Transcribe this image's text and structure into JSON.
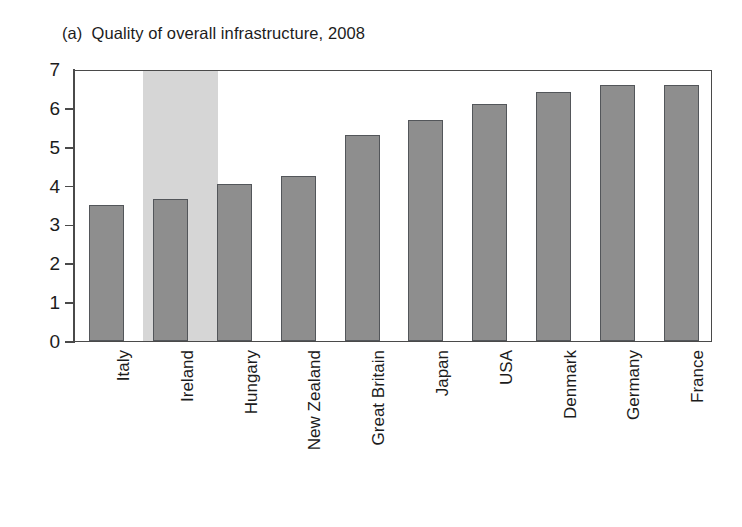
{
  "chart_data": {
    "type": "bar",
    "title_tag": "(a)",
    "title_text": "Quality of overall infrastructure, 2008",
    "xlabel": "",
    "ylabel": "",
    "ylim": [
      0,
      7
    ],
    "ytick_labels": [
      "7",
      "6",
      "5",
      "4",
      "3",
      "2",
      "1",
      "0"
    ],
    "ytick_values": [
      7,
      6,
      5,
      4,
      3,
      2,
      1,
      0
    ],
    "grid": false,
    "legend": "none",
    "categories": [
      "Italy",
      "Ireland",
      "Hungary",
      "New Zealand",
      "Great Britain",
      "Japan",
      "USA",
      "Denmark",
      "Germany",
      "France"
    ],
    "values": [
      3.5,
      3.65,
      4.05,
      4.25,
      5.3,
      5.7,
      6.1,
      6.4,
      6.6,
      6.6
    ],
    "highlight_category": "Ireland",
    "highlight_index": 1,
    "bar_color": "#8e8e8e",
    "bar_edge_color": "#53565a",
    "highlight_band_color": "#d6d6d6",
    "axis_color": "#4a4a4a",
    "background_color": "#ffffff"
  }
}
